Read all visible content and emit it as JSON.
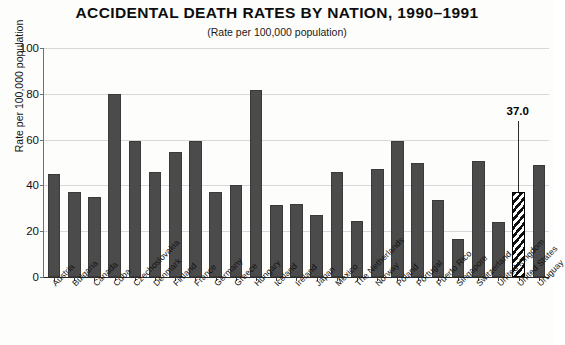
{
  "chart_data": {
    "type": "bar",
    "title": "ACCIDENTAL DEATH RATES BY NATION, 1990–1991",
    "subtitle": "(Rate per 100,000 population)",
    "xlabel": "",
    "ylabel": "Rate per 100,000 population",
    "ylim": [
      0,
      100
    ],
    "ytick_labels": [
      "0",
      "20",
      "40",
      "60",
      "80",
      "100"
    ],
    "ytick_values": [
      0,
      20,
      40,
      60,
      80,
      100
    ],
    "grid": true,
    "legend": "none",
    "bar_color": "#4b4b4b",
    "highlight_color": "#000000",
    "highlight_pattern": "diagonal-hatch",
    "categories": [
      "Austria",
      "Bulgaria",
      "Canada",
      "Cuba",
      "Czechoslovakia",
      "Denmark",
      "Finland",
      "France",
      "Germany",
      "Greece",
      "Hungary",
      "Iceland",
      "Ireland",
      "Japan",
      "Mexico",
      "The Netherlands",
      "Norway",
      "Poland",
      "Portugal",
      "Puerto Rico",
      "Singapore",
      "Switzerland",
      "United Kingdom",
      "United States",
      "Uruguay"
    ],
    "values": [
      45.0,
      37.0,
      35.0,
      80.0,
      59.5,
      46.0,
      54.5,
      59.5,
      37.0,
      40.0,
      81.5,
      31.5,
      32.0,
      27.0,
      46.0,
      24.5,
      47.0,
      59.5,
      50.0,
      33.5,
      16.5,
      50.5,
      24.0,
      37.0,
      49.0
    ],
    "highlighted_category": "United States",
    "annotations": [
      {
        "label": "37.0",
        "category": "United States",
        "value": 37.0
      }
    ]
  }
}
